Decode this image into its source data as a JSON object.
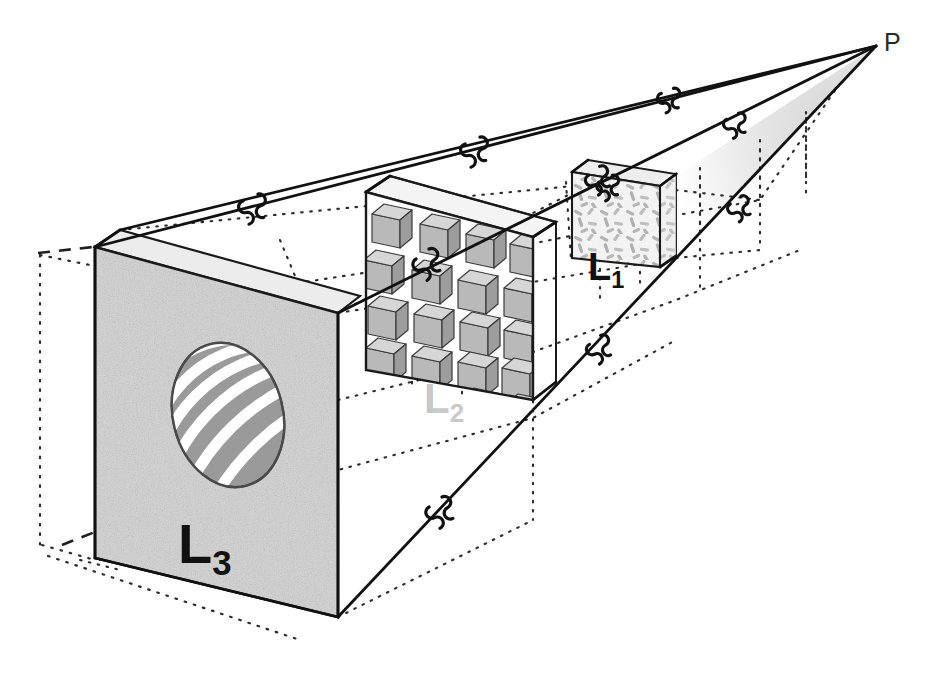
{
  "figure": {
    "type": "diagram",
    "background_color": "#ffffff",
    "width": 940,
    "height": 693
  },
  "apex": {
    "label": "P",
    "name": "viewpoint-apex",
    "x": 884,
    "y": 44,
    "color": "#2a2a2a"
  },
  "labels": [
    {
      "id": "L1",
      "base": "L",
      "sub": "1",
      "color": "#111111",
      "x": 588,
      "y": 248,
      "size": 38
    },
    {
      "id": "L2",
      "base": "L",
      "sub": "2",
      "color": "#c9c9c9",
      "x": 424,
      "y": 378,
      "size": 42
    },
    {
      "id": "L3",
      "base": "L",
      "sub": "3",
      "color": "#111111",
      "x": 178,
      "y": 516,
      "size": 56
    }
  ],
  "panels": [
    {
      "id": "L1",
      "name": "scale-panel-l1",
      "texture": "random-rods",
      "description": "Small box with randomly oriented short gray rods / dashes",
      "fill": "#f4f4f4",
      "rod_color": "#b8b8b8",
      "side_fill": "#e2e2e2",
      "top_fill": "#ededed"
    },
    {
      "id": "L2",
      "name": "scale-panel-l2",
      "texture": "cube-array",
      "description": "Mid-scale slab containing a regular array of small gray 3D cubes",
      "fill": "#ffffff",
      "cube_front": "#b9b9b9",
      "cube_top": "#d4d4d4",
      "cube_side": "#9d9d9d",
      "rows": 5,
      "cols": 4
    },
    {
      "id": "L3",
      "name": "scale-panel-l3",
      "texture": "speckle-noise",
      "description": "Large front panel of speckled gray noise with a striped ellipse aperture",
      "fill": "#d2d2d2",
      "ellipse": {
        "name": "striped-ellipse-aperture",
        "band_color": "#9a9a9a",
        "gap_color": "#ffffff",
        "outline": "#4a4a4a",
        "bands": 5
      }
    }
  ],
  "edges": {
    "name": "frustum-edges",
    "color": "#1a1a1a",
    "width": 2.6,
    "break_symbol": "squiggle-break",
    "break_count": 8
  },
  "construction_lines": {
    "name": "construction-grid",
    "style": "dotted",
    "color": "#2b2b2b",
    "dash_style": "dashed",
    "description": "Dotted perspective grid lines and dashed extension lines marking scale cell boundaries"
  },
  "shading": {
    "apex_wedge_fill": "#d8d8d8",
    "panel_top_fill": "#e8e8e8"
  }
}
